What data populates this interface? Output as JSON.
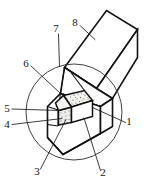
{
  "figure": {
    "kind": "line-art-technical-diagram",
    "background_color": "#ffffff",
    "line_color": "#111111",
    "detail_circle": {
      "name": "detail-view-circle",
      "center_x": 74,
      "center_y": 112,
      "radius": 48,
      "stroke_color": "#2b2b2b"
    },
    "callouts": [
      {
        "id": "1",
        "label": "1",
        "x": 129,
        "y": 125,
        "leader_to_x": 92,
        "leader_to_y": 108
      },
      {
        "id": "2",
        "label": "2",
        "x": 103,
        "y": 176,
        "leader_to_x": 84,
        "leader_to_y": 118
      },
      {
        "id": "3",
        "label": "3",
        "x": 37,
        "y": 175,
        "leader_to_x": 66,
        "leader_to_y": 120
      },
      {
        "id": "4",
        "label": "4",
        "x": 7,
        "y": 128,
        "leader_to_x": 62,
        "leader_to_y": 119
      },
      {
        "id": "5",
        "label": "5",
        "x": 7,
        "y": 112,
        "leader_to_x": 58,
        "leader_to_y": 110
      },
      {
        "id": "6",
        "label": "6",
        "x": 26,
        "y": 67,
        "leader_to_x": 66,
        "leader_to_y": 99
      },
      {
        "id": "7",
        "label": "7",
        "x": 56,
        "y": 32,
        "leader_to_x": 59,
        "leader_to_y": 66
      },
      {
        "id": "8",
        "label": "8",
        "x": 75,
        "y": 26,
        "leader_to_x": 95,
        "leader_to_y": 39
      }
    ]
  }
}
